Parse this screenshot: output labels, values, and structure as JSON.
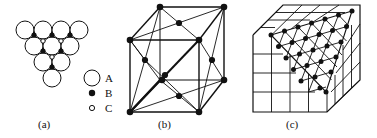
{
  "figure": {
    "panels": [
      {
        "id": "a",
        "caption": "(a)",
        "description": "close-packed layer of spheres with B and C interstitial sites"
      },
      {
        "id": "b",
        "caption": "(b)",
        "description": "cube with face-centred atoms and diagonal connections"
      },
      {
        "id": "c",
        "caption": "(c)",
        "description": "cube with (111) plane showing triangular close-packed lattice"
      }
    ],
    "legend": [
      {
        "symbol": "open-large-circle",
        "label": "A"
      },
      {
        "symbol": "filled-dot",
        "label": "B"
      },
      {
        "symbol": "open-small-circle",
        "label": "C"
      }
    ]
  },
  "colors": {
    "ink": "#111111",
    "background": "#ffffff"
  }
}
